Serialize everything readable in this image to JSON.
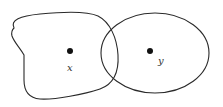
{
  "diagram": {
    "type": "set-diagram",
    "regions": [
      {
        "id": "left-region",
        "shape": "irregular-blob"
      },
      {
        "id": "right-region",
        "shape": "ellipse"
      }
    ],
    "points": [
      {
        "id": "x",
        "label": "x",
        "region": "left-region"
      },
      {
        "id": "y",
        "label": "y",
        "region": "right-region"
      }
    ],
    "colors": {
      "stroke": "#2a2a2a",
      "point": "#111111",
      "label": "#333333",
      "background": "#ffffff"
    }
  }
}
